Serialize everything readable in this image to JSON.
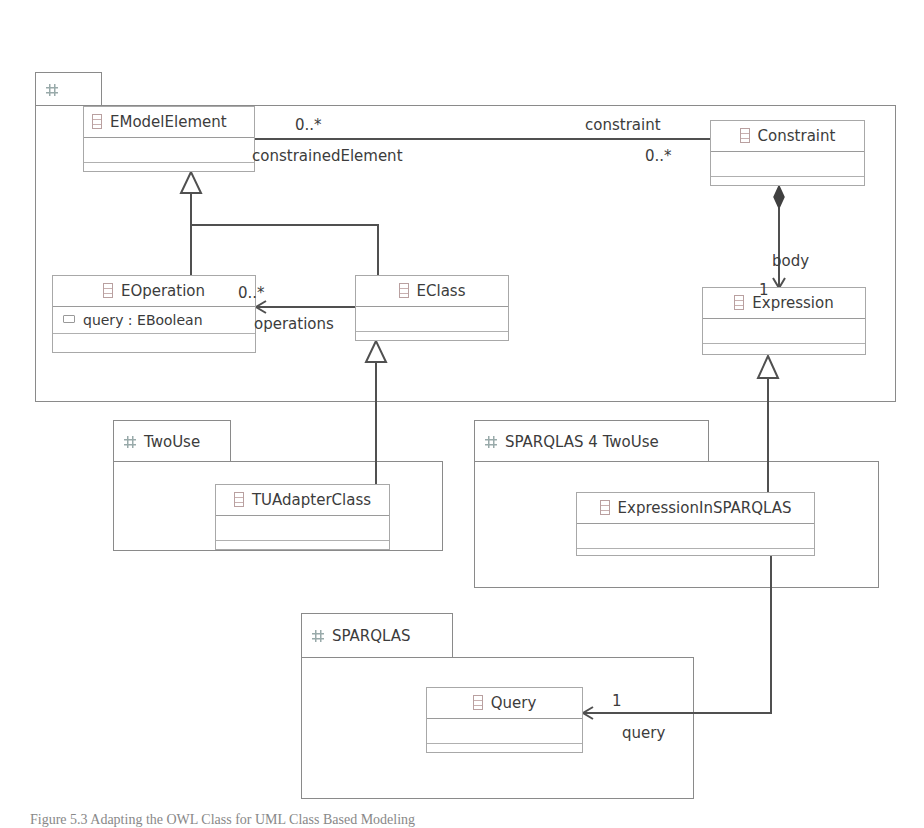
{
  "packages": [
    {
      "id": "ecore",
      "name": "Ecore"
    },
    {
      "id": "twouse",
      "name": "TwoUse"
    },
    {
      "id": "sparqlas4twouse",
      "name": "SPARQLAS 4 TwoUse"
    },
    {
      "id": "sparqlas",
      "name": "SPARQLAS"
    }
  ],
  "classes": {
    "emodelelement": {
      "name": "EModelElement"
    },
    "constraint": {
      "name": "Constraint"
    },
    "eoperation": {
      "name": "EOperation",
      "attributes": [
        "query : EBoolean"
      ]
    },
    "eclass": {
      "name": "EClass"
    },
    "expression": {
      "name": "Expression"
    },
    "tuadapterclass": {
      "name": "TUAdapterClass"
    },
    "expressioninsparqlas": {
      "name": "ExpressionInSPARQLAS"
    },
    "query": {
      "name": "Query"
    }
  },
  "associations": {
    "constraint_assoc": {
      "source_mult": "0..*",
      "source_role": "constrainedElement",
      "target_mult": "0..*",
      "target_role": "constraint"
    },
    "body_assoc": {
      "role": "body",
      "mult": "1"
    },
    "operations_assoc": {
      "role": "operations",
      "mult": "0..*"
    },
    "query_assoc": {
      "role": "query",
      "mult": "1"
    }
  },
  "caption": "Figure 5.3  Adapting the OWL Class for UML Class Based Modeling"
}
